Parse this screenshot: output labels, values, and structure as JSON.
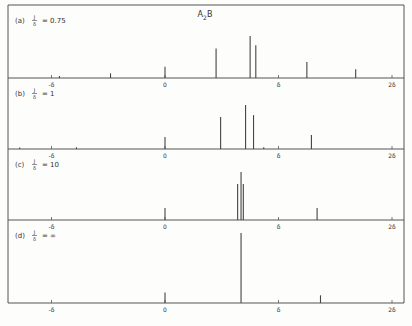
{
  "chart_data": {
    "type": "stick-spectrum",
    "title": "A2B",
    "title_main": "A",
    "title_sub": "2",
    "title_tail": "B",
    "xlabel": "",
    "ylabel": "",
    "x_ticks": [
      {
        "value": -1,
        "label": "-δ"
      },
      {
        "value": 0,
        "label": "0"
      },
      {
        "value": 1,
        "label": "δ"
      },
      {
        "value": 2,
        "label": "2δ"
      }
    ],
    "xlim": [
      -1.38,
      2.11
    ],
    "grid": false,
    "panels": [
      {
        "id": "a",
        "label": "(a)",
        "ratio_num": "J",
        "ratio_den": "δ",
        "ratio_value": "0.75",
        "lines": [
          {
            "x": -0.93,
            "h": 0.05
          },
          {
            "x": -0.48,
            "h": 0.11
          },
          {
            "x": 0.0,
            "h": 0.27
          },
          {
            "x": 0.45,
            "h": 0.7
          },
          {
            "x": 0.75,
            "h": 1.0
          },
          {
            "x": 0.8,
            "h": 0.78
          },
          {
            "x": 1.25,
            "h": 0.38
          },
          {
            "x": 1.68,
            "h": 0.21
          }
        ]
      },
      {
        "id": "b",
        "label": "(b)",
        "ratio_num": "J",
        "ratio_den": "δ",
        "ratio_value": "1",
        "lines": [
          {
            "x": -1.28,
            "h": 0.03
          },
          {
            "x": -0.78,
            "h": 0.04
          },
          {
            "x": 0.0,
            "h": 0.27
          },
          {
            "x": 0.49,
            "h": 0.73
          },
          {
            "x": 0.71,
            "h": 1.0
          },
          {
            "x": 0.78,
            "h": 0.77
          },
          {
            "x": 0.87,
            "h": 0.04
          },
          {
            "x": 1.29,
            "h": 0.32
          }
        ]
      },
      {
        "id": "c",
        "label": "(c)",
        "ratio_num": "J",
        "ratio_den": "δ",
        "ratio_value": "10",
        "lines": [
          {
            "x": 0.0,
            "h": 0.25
          },
          {
            "x": 0.64,
            "h": 0.75
          },
          {
            "x": 0.67,
            "h": 1.0
          },
          {
            "x": 0.69,
            "h": 0.75
          },
          {
            "x": 1.34,
            "h": 0.25
          }
        ]
      },
      {
        "id": "d",
        "label": "(d)",
        "ratio_num": "J",
        "ratio_den": "δ",
        "ratio_value": "∞",
        "lines": [
          {
            "x": 0.0,
            "h": 0.15
          },
          {
            "x": 0.67,
            "h": 1.0
          },
          {
            "x": 1.37,
            "h": 0.11
          }
        ]
      }
    ]
  },
  "layout": {
    "x0_px": 165,
    "unit_px": 113.5,
    "axis_y": [
      78,
      149,
      220,
      303
    ],
    "max_height_px": [
      42,
      44,
      48,
      70
    ],
    "frame": {
      "left": 8,
      "top": 5,
      "right": 404,
      "bottom": 303
    },
    "line_color": "#444444",
    "frame_color": "#555555"
  }
}
